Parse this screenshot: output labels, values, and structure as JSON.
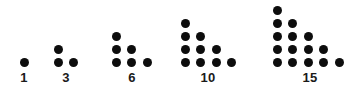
{
  "figure": {
    "background_color": "#ffffff",
    "dot_color": "#0d0d0d",
    "label_color": "#1a1a1a",
    "dot_diameter": 9,
    "column_spacing": 15.5,
    "row_spacing": 13,
    "baseline_y": 62,
    "label_y": 71
  },
  "chart_data": {
    "type": "scatter",
    "title": "",
    "xlabel": "",
    "ylabel": "",
    "categories": [
      "1",
      "3",
      "6",
      "10",
      "15"
    ],
    "values": [
      1,
      3,
      6,
      10,
      15
    ],
    "groups": [
      {
        "label": "1",
        "total_dots": 1,
        "rows": [
          1
        ],
        "origin_x": 24,
        "label_x": 24
      },
      {
        "label": "3",
        "total_dots": 3,
        "rows": [
          1,
          2
        ],
        "origin_x": 58,
        "label_x": 66
      },
      {
        "label": "6",
        "total_dots": 6,
        "rows": [
          1,
          2,
          3
        ],
        "origin_x": 116,
        "label_x": 132
      },
      {
        "label": "10",
        "total_dots": 10,
        "rows": [
          1,
          2,
          3,
          4
        ],
        "origin_x": 185,
        "label_x": 208
      },
      {
        "label": "15",
        "total_dots": 15,
        "rows": [
          1,
          2,
          3,
          4,
          5
        ],
        "origin_x": 277,
        "label_x": 310
      }
    ]
  }
}
